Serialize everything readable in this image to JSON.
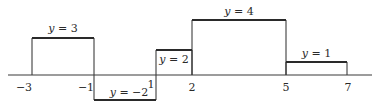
{
  "chart_data": {
    "type": "line",
    "subtype": "step-function",
    "title": "",
    "xlabel": "",
    "ylabel": "",
    "grid": false,
    "legend": null,
    "x_ticks": [
      -3,
      -1,
      1,
      2,
      5,
      7
    ],
    "x_tick_labels": [
      "−3",
      "−1",
      "1",
      "2",
      "5",
      "7"
    ],
    "segments": [
      {
        "x_start": -3,
        "x_end": -1,
        "y": 3,
        "label": "y = 3"
      },
      {
        "x_start": -1,
        "x_end": 1,
        "y": -2,
        "label": "y = −2"
      },
      {
        "x_start": 1,
        "x_end": 2,
        "y": 2,
        "label": "y = 2"
      },
      {
        "x_start": 2,
        "x_end": 5,
        "y": 4,
        "label": "y = 4"
      },
      {
        "x_start": 5,
        "x_end": 7,
        "y": 1,
        "label": "y = 1"
      }
    ],
    "xlim": [
      -3.8,
      7.8
    ],
    "ylim": [
      -2.5,
      4.5
    ]
  },
  "style": {
    "line_color": "#2a2a2a",
    "axis_color": "#3a3a3a",
    "background": "#ffffff"
  }
}
